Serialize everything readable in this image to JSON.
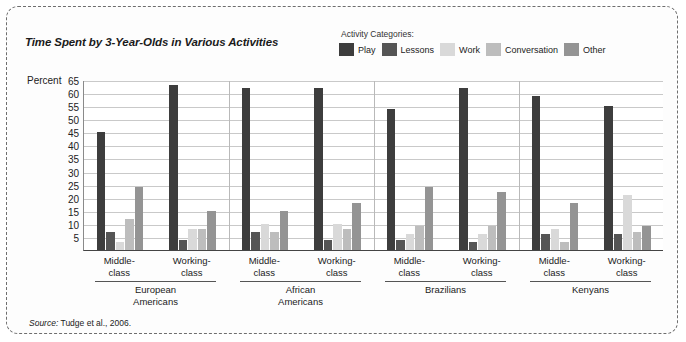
{
  "figure": {
    "title": "Time Spent by 3-Year-Olds in Various Activities",
    "source_word": "Source:",
    "source_text": " Tudge et al., 2006."
  },
  "legend": {
    "title": "Activity Categories:",
    "items": [
      {
        "label": "Play",
        "color": "#3d3d3d"
      },
      {
        "label": "Lessons",
        "color": "#555555"
      },
      {
        "label": "Work",
        "color": "#d9d9d9"
      },
      {
        "label": "Conversation",
        "color": "#bdbdbd"
      },
      {
        "label": "Other",
        "color": "#949494"
      }
    ]
  },
  "axis": {
    "ylabel": "Percent",
    "yticks": [
      65,
      60,
      55,
      50,
      45,
      40,
      35,
      30,
      25,
      20,
      15,
      10,
      5
    ]
  },
  "chart_data": {
    "type": "bar",
    "title": "Time Spent by 3-Year-Olds in Various Activities",
    "xlabel": "",
    "ylabel": "Percent",
    "ylim": [
      0,
      65
    ],
    "grid": true,
    "legend_position": "top-right",
    "legend_title": "Activity Categories:",
    "categories": [
      "European Americans / Middle-class",
      "European Americans / Working-class",
      "African Americans / Middle-class",
      "African Americans / Working-class",
      "Brazilians / Middle-class",
      "Brazilians / Working-class",
      "Kenyans / Middle-class",
      "Kenyans / Working-class"
    ],
    "groups": [
      {
        "name": "European Americans",
        "subgroups": [
          {
            "name": "Middle-class",
            "values": [
              45,
              7,
              3,
              12,
              24
            ]
          },
          {
            "name": "Working-class",
            "values": [
              63,
              4,
              8,
              8,
              15
            ]
          }
        ]
      },
      {
        "name": "African Americans",
        "subgroups": [
          {
            "name": "Middle-class",
            "values": [
              62,
              7,
              10,
              7,
              15
            ]
          },
          {
            "name": "Working-class",
            "values": [
              62,
              4,
              10,
              8,
              18
            ]
          }
        ]
      },
      {
        "name": "Brazilians",
        "subgroups": [
          {
            "name": "Middle-class",
            "values": [
              54,
              4,
              6,
              9,
              24
            ]
          },
          {
            "name": "Working-class",
            "values": [
              62,
              3,
              6,
              9,
              22
            ]
          }
        ]
      },
      {
        "name": "Kenyans",
        "subgroups": [
          {
            "name": "Middle-class",
            "values": [
              59,
              6,
              8,
              3,
              18
            ]
          },
          {
            "name": "Working-class",
            "values": [
              55,
              6,
              21,
              7,
              9
            ]
          }
        ]
      }
    ],
    "series": [
      {
        "name": "Play",
        "color": "#3d3d3d",
        "values": [
          45,
          63,
          62,
          62,
          54,
          62,
          59,
          55
        ]
      },
      {
        "name": "Lessons",
        "color": "#555555",
        "values": [
          7,
          4,
          7,
          4,
          4,
          3,
          6,
          6
        ]
      },
      {
        "name": "Work",
        "color": "#d9d9d9",
        "values": [
          3,
          8,
          10,
          10,
          6,
          6,
          8,
          21
        ]
      },
      {
        "name": "Conversation",
        "color": "#bdbdbd",
        "values": [
          12,
          8,
          7,
          8,
          9,
          9,
          3,
          7
        ]
      },
      {
        "name": "Other",
        "color": "#949494",
        "values": [
          24,
          15,
          15,
          18,
          24,
          22,
          18,
          9
        ]
      }
    ]
  }
}
